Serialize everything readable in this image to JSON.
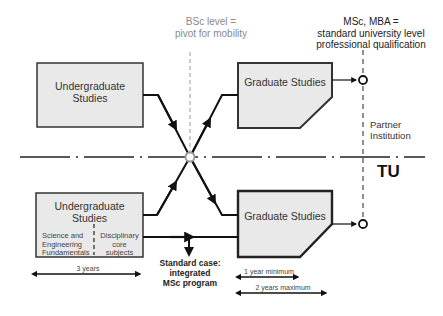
{
  "diagram": {
    "annotations": {
      "bsc_level": [
        "BSc  level =",
        "pivot for mobility"
      ],
      "msc_mba": [
        "MSc, MBA =",
        "standard university level",
        "professional qualification"
      ],
      "partner_institution": [
        "Partner",
        "Institution"
      ],
      "tu": "TU",
      "standard_case": [
        "Standard case:",
        "integrated",
        "MSc program"
      ]
    },
    "partner_row": {
      "undergraduate_box": [
        "Undergraduate",
        "Studies"
      ],
      "graduate_box": "Graduate Studies"
    },
    "tu_row": {
      "undergraduate_box": {
        "title": [
          "Undergraduate",
          "Studies"
        ],
        "left_section": [
          "Science and",
          "Engineering",
          "Fundamentals"
        ],
        "right_section": [
          "Disciplinary",
          "core",
          "subjects"
        ]
      },
      "graduate_box": "Graduate Studies"
    },
    "durations": {
      "undergraduate": "3 years",
      "graduate_min": "1 year minimum",
      "graduate_max": "2 years maximum"
    },
    "colors": {
      "box_fill": "#e9e9e9",
      "line": "#111111",
      "pivot_line": "#9a9a9a"
    }
  }
}
